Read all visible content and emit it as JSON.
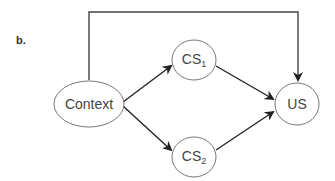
{
  "panel_label": "b.",
  "nodes": {
    "context": {
      "label": "Context"
    },
    "cs1": {
      "label": "CS",
      "subscript": "1"
    },
    "cs2": {
      "label": "CS",
      "subscript": "2"
    },
    "us": {
      "label": "US"
    }
  },
  "edges": [
    {
      "from": "Context",
      "to": "CS1"
    },
    {
      "from": "Context",
      "to": "CS2"
    },
    {
      "from": "CS1",
      "to": "US"
    },
    {
      "from": "CS2",
      "to": "US"
    },
    {
      "from": "Context",
      "to": "US",
      "route": "over-top"
    }
  ],
  "colors": {
    "stroke": "#555555",
    "arrow": "#222222",
    "text": "#444444"
  }
}
